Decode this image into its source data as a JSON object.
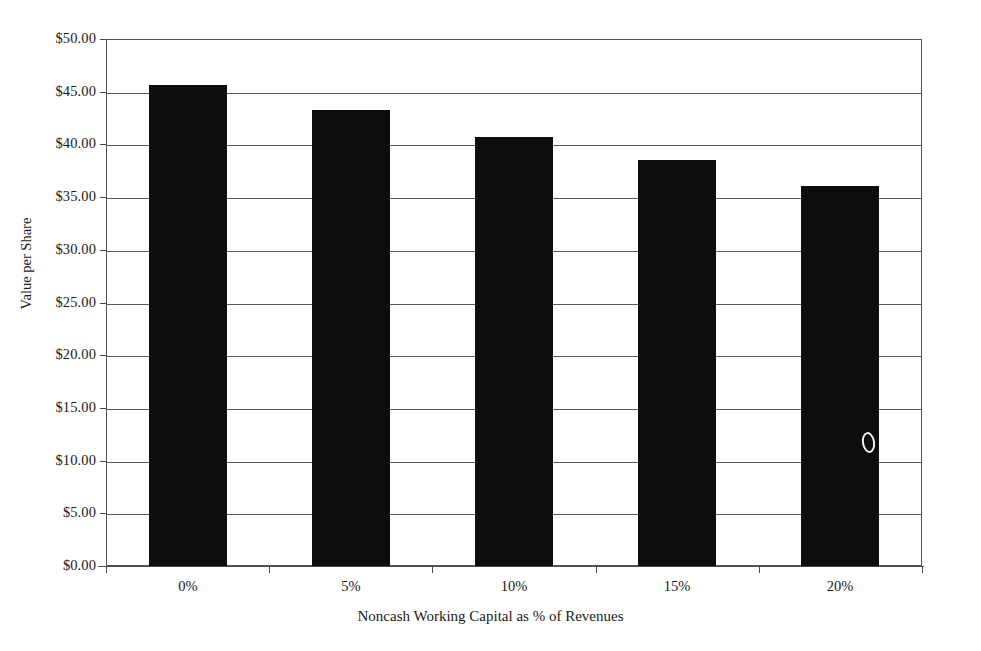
{
  "chart_data": {
    "type": "bar",
    "title": "",
    "xlabel": "Noncash Working Capital as % of Revenues",
    "ylabel": "Value per Share",
    "categories": [
      "0%",
      "5%",
      "10%",
      "15%",
      "20%"
    ],
    "values": [
      45.6,
      43.3,
      40.7,
      38.5,
      36.1
    ],
    "ylim": [
      0,
      50
    ],
    "ytick_step": 5,
    "ytick_labels": [
      "$0.00",
      "$5.00",
      "$10.00",
      "$15.00",
      "$20.00",
      "$25.00",
      "$30.00",
      "$35.00",
      "$40.00",
      "$45.00",
      "$50.00"
    ],
    "ytick_values": [
      0,
      5,
      10,
      15,
      20,
      25,
      30,
      35,
      40,
      45,
      50
    ],
    "grid": true,
    "legend": false,
    "bar_color": "#0d0d0d",
    "gridline_color": "#5a5a5a",
    "background_color": "#ffffff"
  },
  "artifacts": {
    "scan_speck_label": "scan-speck"
  }
}
